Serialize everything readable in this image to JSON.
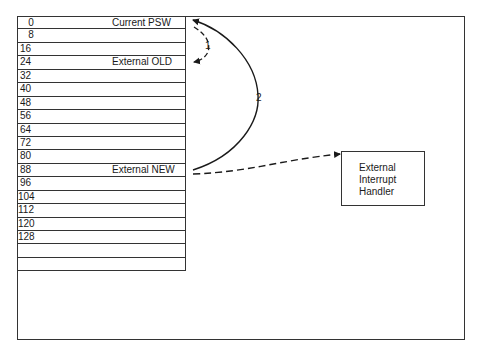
{
  "memory_table": {
    "rows": [
      {
        "address": "0",
        "label": "Current PSW"
      },
      {
        "address": "8",
        "label": ""
      },
      {
        "address": "16",
        "label": ""
      },
      {
        "address": "24",
        "label": "External OLD"
      },
      {
        "address": "32",
        "label": ""
      },
      {
        "address": "40",
        "label": ""
      },
      {
        "address": "48",
        "label": ""
      },
      {
        "address": "56",
        "label": ""
      },
      {
        "address": "64",
        "label": ""
      },
      {
        "address": "72",
        "label": ""
      },
      {
        "address": "80",
        "label": ""
      },
      {
        "address": "88",
        "label": "External NEW"
      },
      {
        "address": "96",
        "label": ""
      },
      {
        "address": "104",
        "label": ""
      },
      {
        "address": "112",
        "label": ""
      },
      {
        "address": "120",
        "label": ""
      },
      {
        "address": "128",
        "label": ""
      },
      {
        "address": "",
        "label": ""
      },
      {
        "address": "",
        "label": ""
      }
    ]
  },
  "handler": {
    "lines": [
      "External",
      "Interrupt",
      "Handler"
    ]
  },
  "arrows": {
    "step1_label": "1",
    "step2_label": "2"
  }
}
